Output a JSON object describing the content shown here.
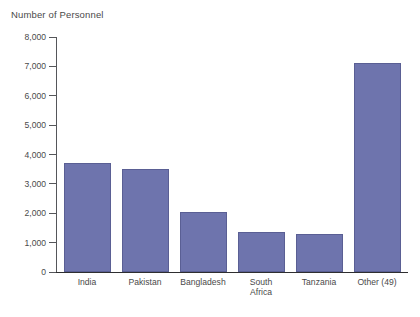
{
  "chart_data": {
    "type": "bar",
    "title": "Number of Personnel",
    "xlabel": "",
    "ylabel": "Number of Personnel",
    "categories": [
      "India",
      "Pakistan",
      "Bangladesh",
      "South\nAfrica",
      "Tanzania",
      "Other (49)"
    ],
    "values": [
      3700,
      3500,
      2050,
      1370,
      1300,
      7100
    ],
    "ylim": [
      0,
      8000
    ],
    "ytick_values": [
      0,
      1000,
      2000,
      3000,
      4000,
      5000,
      6000,
      7000,
      8000
    ],
    "ytick_labels": [
      "0",
      "1,000",
      "2,000",
      "3,000",
      "4,000",
      "5,000",
      "6,000",
      "7,000",
      "8,000"
    ],
    "grid": false,
    "legend": false,
    "legend_position": "none",
    "bar_color": "#6e74ad",
    "bar_edge_color": "#5a5f94",
    "background_color": "#ffffff",
    "axis_color": "#55565a"
  },
  "caption": {
    "cut_off_text": ""
  }
}
